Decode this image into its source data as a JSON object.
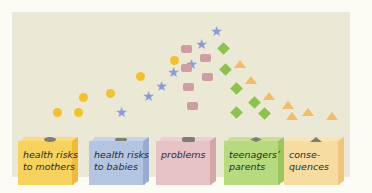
{
  "diagram": {
    "title": "",
    "colors": {
      "background": "#ebe9d6",
      "circles": "#f3c030",
      "stars": "#8c9cd3",
      "squares": "#cf9ea3",
      "diamonds": "#8ec14f",
      "triangles": "#f1bd6a"
    },
    "boxes": [
      {
        "label": "health risks\nto mothers",
        "icon": "circle-slot-icon",
        "front": "#f7d25e",
        "side": "#edbb3d",
        "top": "#f9dd7d"
      },
      {
        "label": "health risks\nto babies",
        "icon": "star-slot-icon",
        "front": "#b4c5e2",
        "side": "#98acd4",
        "top": "#c5d2ea"
      },
      {
        "label": "problems",
        "icon": "square-slot-icon",
        "front": "#e7c2c4",
        "side": "#d4a6aa",
        "top": "#eccfd0"
      },
      {
        "label": "teenagers’\nparents",
        "icon": "diamond-slot-icon",
        "front": "#b8da7e",
        "side": "#9bc65c",
        "top": "#c8e197"
      },
      {
        "label": "conse-\nquences",
        "icon": "triangle-slot-icon",
        "front": "#f7dca2",
        "side": "#efc67a",
        "top": "#f9e4b6"
      }
    ]
  }
}
